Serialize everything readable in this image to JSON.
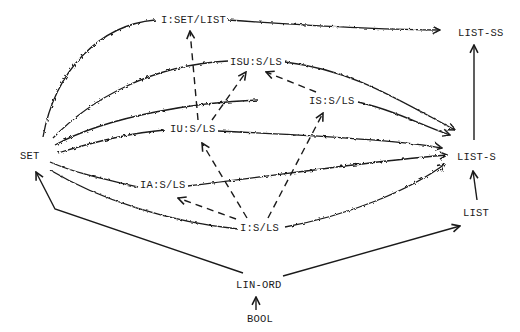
{
  "diagram": {
    "type": "type-hierarchy-graph",
    "nodes": {
      "i_set_list": "I:SET/LIST",
      "list_ss": "LIST-SS",
      "isu_s_ls": "ISU:S/LS",
      "is_s_ls": "IS:S/LS",
      "iu_s_ls": "IU:S/LS",
      "set": "SET",
      "list_s": "LIST-S",
      "ia_s_ls": "IA:S/LS",
      "i_s_ls": "I:S/LS",
      "list": "LIST",
      "lin_ord": "LIN-ORD",
      "bool": "BOOL"
    },
    "edges": [
      {
        "from": "SET",
        "to": "I:SET/LIST",
        "style": "wavy"
      },
      {
        "from": "I:SET/LIST",
        "to": "LIST-SS",
        "style": "wavy"
      },
      {
        "from": "SET",
        "to": "ISU:S/LS",
        "style": "wavy"
      },
      {
        "from": "ISU:S/LS",
        "to": "LIST-S",
        "style": "wavy"
      },
      {
        "from": "SET",
        "to": "IS:S/LS",
        "style": "wavy"
      },
      {
        "from": "IS:S/LS",
        "to": "LIST-S",
        "style": "wavy"
      },
      {
        "from": "SET",
        "to": "IU:S/LS",
        "style": "wavy"
      },
      {
        "from": "IU:S/LS",
        "to": "LIST-S",
        "style": "wavy"
      },
      {
        "from": "SET",
        "to": "IA:S/LS",
        "style": "wavy"
      },
      {
        "from": "IA:S/LS",
        "to": "LIST-S",
        "style": "wavy"
      },
      {
        "from": "SET",
        "to": "I:S/LS",
        "style": "wavy"
      },
      {
        "from": "I:S/LS",
        "to": "LIST-S",
        "style": "wavy"
      },
      {
        "from": "IU:S/LS",
        "to": "I:SET/LIST",
        "style": "dashed"
      },
      {
        "from": "IU:S/LS",
        "to": "ISU:S/LS",
        "style": "dashed"
      },
      {
        "from": "IS:S/LS",
        "to": "ISU:S/LS",
        "style": "dashed"
      },
      {
        "from": "I:S/LS",
        "to": "IU:S/LS",
        "style": "dashed"
      },
      {
        "from": "I:S/LS",
        "to": "IS:S/LS",
        "style": "dashed"
      },
      {
        "from": "I:S/LS",
        "to": "IA:S/LS",
        "style": "dashed"
      },
      {
        "from": "LIN-ORD",
        "to": "SET",
        "style": "solid"
      },
      {
        "from": "LIN-ORD",
        "to": "LIST",
        "style": "solid"
      },
      {
        "from": "BOOL",
        "to": "LIN-ORD",
        "style": "solid"
      },
      {
        "from": "LIST",
        "to": "LIST-S",
        "style": "solid"
      },
      {
        "from": "LIST-S",
        "to": "LIST-SS",
        "style": "solid"
      }
    ]
  }
}
